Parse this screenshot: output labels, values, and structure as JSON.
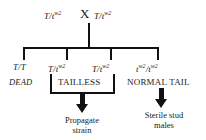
{
  "diagram": {
    "ink_color": "#111111",
    "background_color": "#ffffff",
    "cross_symbol": "X",
    "parents": [
      {
        "id": "parent-left",
        "allele1": "T",
        "separator": "/",
        "allele2": "t",
        "allele2_sup": "w2",
        "text": "T/t"
      },
      {
        "id": "parent-right",
        "allele1": "T",
        "separator": "/",
        "allele2": "t",
        "allele2_sup": "w2",
        "text": "T/t"
      }
    ],
    "offspring": [
      {
        "id": "offspring-1",
        "genotype_main": "T/T",
        "genotype_sup": "",
        "genotype_tail": "",
        "phenotype": "DEAD",
        "phenotype_style": "italic",
        "bracketed": false
      },
      {
        "id": "offspring-2",
        "genotype_main": "T/t",
        "genotype_sup": "w2",
        "genotype_tail": "",
        "phenotype": "TAILLESS",
        "phenotype_style": "caps",
        "bracketed": true
      },
      {
        "id": "offspring-3",
        "genotype_main": "T/t",
        "genotype_sup": "w2",
        "genotype_tail": "",
        "phenotype": "TAILLESS",
        "phenotype_style": "caps",
        "bracketed": true
      },
      {
        "id": "offspring-4",
        "genotype_main": "t",
        "genotype_sup": "w2",
        "genotype_tail": "/t",
        "genotype_sup2": "w2",
        "phenotype": "NORMAL TAIL",
        "phenotype_style": "caps",
        "bracketed": false
      }
    ],
    "phenotype_groups": [
      {
        "id": "group-tailless",
        "label": "TAILLESS",
        "spans": [
          "offspring-2",
          "offspring-3"
        ]
      },
      {
        "id": "group-normal-tail",
        "label": "NORMAL TAIL",
        "spans": [
          "offspring-4"
        ]
      }
    ],
    "outcomes": [
      {
        "id": "outcome-left",
        "line1": "Propagate",
        "line2": "strain"
      },
      {
        "id": "outcome-right",
        "line1": "Sterile stud",
        "line2": "males"
      }
    ]
  }
}
